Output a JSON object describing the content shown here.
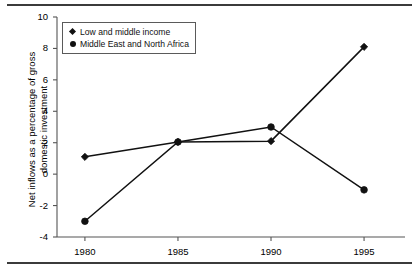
{
  "chart_data": {
    "type": "line",
    "title": "",
    "subtitle": "",
    "xlabel": "",
    "ylabel": "Net inflows as a percentage of gross\ndomestic investment",
    "x": [
      1980,
      1985,
      1990,
      1995
    ],
    "categories": [
      "1980",
      "1985",
      "1990",
      "1995"
    ],
    "xtick_labels": [
      "1980",
      "1985",
      "1990",
      "1995"
    ],
    "ytick_labels": [
      "10",
      "8",
      "6",
      "4",
      "2",
      "0",
      "-2",
      "-4"
    ],
    "yticks": [
      10,
      8,
      6,
      4,
      2,
      0,
      -2,
      -4
    ],
    "ylim": [
      -4,
      10
    ],
    "xlim": [
      1978.5,
      1997.2
    ],
    "grid": false,
    "legend_position": "top-left",
    "series": [
      {
        "name": "Low and middle income",
        "marker": "diamond",
        "color": "#111111",
        "values": [
          1.1,
          2.05,
          2.1,
          8.1
        ]
      },
      {
        "name": "Middle East and North Africa",
        "marker": "circle",
        "color": "#111111",
        "values": [
          -3.0,
          2.05,
          3.0,
          -1.0
        ]
      }
    ]
  },
  "legend": {
    "items": [
      {
        "label": "Low and middle income",
        "marker": "diamond"
      },
      {
        "label": "Middle East and North Africa",
        "marker": "circle"
      }
    ]
  },
  "axes": {
    "y_title": "Net inflows as a percentage of gross\ndomestic investment"
  },
  "colors": {
    "line": "#111111",
    "axis": "#555555",
    "rule": "#3b3b3b",
    "background": "#ffffff"
  }
}
